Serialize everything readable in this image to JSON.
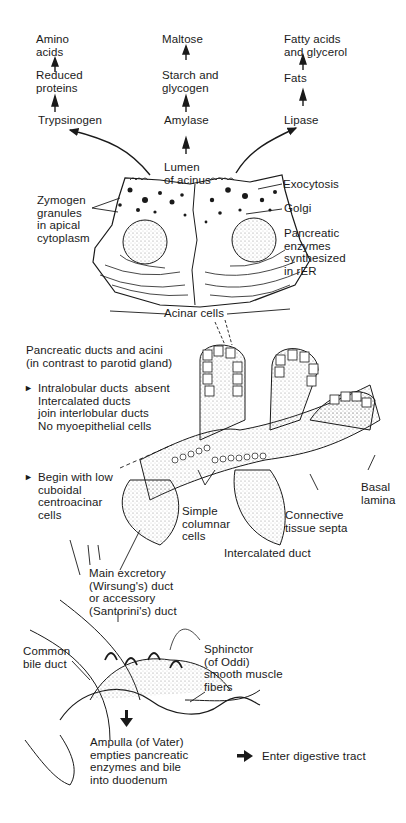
{
  "pathways": {
    "protein": {
      "product": "Amino\nacids",
      "intermediate": "Reduced\nproteins",
      "enzyme": "Trypsinogen"
    },
    "carbohydrate": {
      "product": "Maltose",
      "intermediate": "Starch and\nglycogen",
      "enzyme": "Amylase"
    },
    "lipid": {
      "product": "Fatty acids\nand glycerol",
      "intermediate": "Fats",
      "enzyme": "Lipase"
    }
  },
  "acinus": {
    "lumen": "Lumen\nof acinus",
    "zymogen": "Zymogen\ngranules\nin apical\ncytoplasm",
    "exocytosis": "Exocytosis",
    "golgi": "Golgi",
    "rer": "Pancreatic\nenzymes\nsynthesized\nin rER",
    "acinar_cells": "Acinar cells"
  },
  "ducts": {
    "title": "Pancreatic ducts and acini\n(in contrast to parotid gland)",
    "point1": "Intralobular ducts  absent\nIntercalated ducts\njoin interlobular ducts\nNo myoepithelial cells",
    "point2": "Begin with low\ncuboidal\ncentroacinar\ncells",
    "basal_lamina": "Basal\nlamina",
    "connective": "Connective\ntissue septa",
    "simple_columnar": "Simple\ncolumnar\ncells",
    "intercalated": "Intercalated duct"
  },
  "ampulla": {
    "main_duct": "Main excretory\n(Wirsung's) duct\nor accessory\n(Santorini's) duct",
    "common_bile": "Common\nbile duct",
    "sphincter": "Sphinctor\n(of Oddi)\nsmooth muscle\nfibers",
    "ampulla": "Ampulla (of Vater)\nempties pancreatic\nenzymes and bile\ninto duodenum"
  },
  "legend": {
    "arrow_label": "Enter digestive tract"
  },
  "colors": {
    "ink": "#1a1a1a",
    "background": "#ffffff",
    "stipple": "#9a9a9a"
  }
}
